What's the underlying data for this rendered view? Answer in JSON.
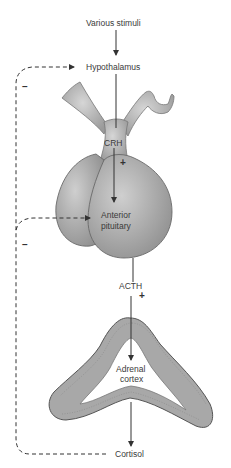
{
  "diagram": {
    "nodes": {
      "stimuli": "Various stimuli",
      "hypothalamus": "Hypothalamus",
      "crh": "CRH",
      "anterior_pituitary_line1": "Anterior",
      "anterior_pituitary_line2": "pituitary",
      "acth": "ACTH",
      "adrenal_cortex_line1": "Adrenal",
      "adrenal_cortex_line2": "cortex",
      "cortisol": "Cortisol"
    },
    "signs": {
      "crh_effect": "+",
      "acth_effect": "+",
      "feedback_hypothalamus": "–",
      "feedback_pituitary": "–"
    },
    "colors": {
      "gland_fill": "#b8b8b8",
      "gland_stroke": "#6a6a6a",
      "arrow": "#333333",
      "adrenal_fill": "#a9a9a9"
    }
  }
}
